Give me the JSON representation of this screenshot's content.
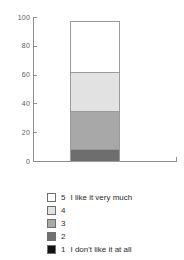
{
  "chart_data": {
    "type": "bar",
    "subtype": "stacked-bar-100",
    "title": "",
    "subtitle": "",
    "xlabel": "",
    "ylabel": "",
    "ylim": [
      0,
      100
    ],
    "yticks": [
      0,
      20,
      40,
      60,
      80,
      100
    ],
    "ytick_labels": [
      "0",
      "20",
      "40",
      "60",
      "80",
      "100"
    ],
    "xticks": [],
    "xtick_labels": [],
    "grid": false,
    "categories": [
      ""
    ],
    "legend_position": "bottom-left",
    "stack_order_bottom_to_top": [
      "1",
      "2",
      "3",
      "4",
      "5"
    ],
    "series": [
      {
        "name": "1",
        "label": "1  I don't like it at all",
        "color": "#111111",
        "values": [
          0
        ],
        "start": 0,
        "end": 0
      },
      {
        "name": "2",
        "label": "2",
        "color": "#6e6e6e",
        "values": [
          9
        ],
        "start": 0,
        "end": 9
      },
      {
        "name": "3",
        "label": "3",
        "color": "#a8a8a8",
        "values": [
          27
        ],
        "start": 9,
        "end": 36
      },
      {
        "name": "4",
        "label": "4",
        "color": "#e2e2e2",
        "values": [
          28
        ],
        "start": 36,
        "end": 64
      },
      {
        "name": "5",
        "label": "5  I like it very much",
        "color": "#ffffff",
        "values": [
          36
        ],
        "start": 64,
        "end": 100
      }
    ]
  },
  "axis": {
    "tick_labels": [
      "100",
      "80",
      "60",
      "40",
      "20",
      "0"
    ],
    "tick_values": [
      100,
      80,
      60,
      40,
      20,
      0
    ],
    "line_color": "#8d8d8d"
  },
  "legend": {
    "items": [
      {
        "key": "5",
        "description": "I like it very much",
        "color": "#ffffff"
      },
      {
        "key": "4",
        "description": "",
        "color": "#e2e2e2"
      },
      {
        "key": "3",
        "description": "",
        "color": "#a8a8a8"
      },
      {
        "key": "2",
        "description": "",
        "color": "#6e6e6e"
      },
      {
        "key": "1",
        "description": "I don't like it at all",
        "color": "#111111"
      }
    ]
  },
  "colors": {
    "background": "#ffffff",
    "axis": "#8d8d8d",
    "bar_border": "#9a9a9a",
    "text": "#2b2b2b",
    "tick_text": "#5a5a5a"
  }
}
